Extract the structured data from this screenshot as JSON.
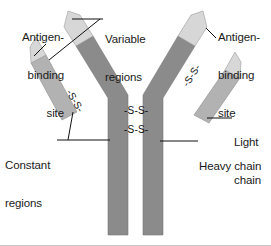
{
  "figure": {
    "background_color": "#ffffff",
    "colors": {
      "variable_region": "#d2d2d2",
      "constant_region_heavy": "#8b8b8b",
      "constant_region_light": "#b0b0b0",
      "outline": "#6e6e6e",
      "leader_line": "#111111",
      "text": "#1a1a1a"
    }
  },
  "labels": {
    "antigen_binding_site_left": {
      "lines": [
        "Antigen-",
        "binding",
        "site"
      ],
      "align": "right"
    },
    "antigen_binding_site_right": {
      "lines": [
        "Antigen-",
        "binding",
        "site"
      ],
      "align": "left"
    },
    "variable_regions": {
      "lines": [
        "Variable",
        "regions"
      ],
      "align": "left"
    },
    "constant_regions": {
      "lines": [
        "Constant",
        "regions"
      ],
      "align": "left"
    },
    "light_chain": {
      "lines": [
        "Light",
        "chain"
      ],
      "align": "left"
    },
    "heavy_chain": {
      "lines": [
        "Heavy chain"
      ],
      "align": "left"
    }
  },
  "disulfide_bonds": {
    "notation": "-S-S-",
    "hinge_upper": "-S-S-",
    "hinge_lower": "-S-S-",
    "left_arm": "-S-S-",
    "right_arm": "-S-S-",
    "count": 4
  },
  "chains": {
    "heavy_chain_count": 2,
    "light_chain_count": 2
  }
}
